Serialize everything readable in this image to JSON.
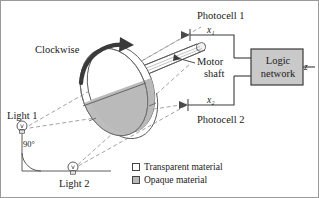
{
  "figure": {
    "border_color": "#9a9a9a",
    "background": "#ffffff"
  },
  "labels": {
    "photocell_1": "Photocell 1",
    "photocell_2": "Photocell 2",
    "input_x1": "x₁",
    "input_x2": "x₂",
    "motor_line1": "Motor",
    "motor_line2": "shaft",
    "clockwise": "Clockwise",
    "light_1": "Light 1",
    "light_2": "Light 2",
    "angle": "90°",
    "output_z": "z",
    "logic_line1": "Logic",
    "logic_line2": "network"
  },
  "legend": {
    "items": [
      {
        "label": "Transparent material",
        "swatch": "transparent-swatch",
        "color": "#ffffff"
      },
      {
        "label": "Opaque material",
        "swatch": "opaque-swatch",
        "color": "#b9b9b9"
      }
    ]
  },
  "colors": {
    "opaque_fill": "#b9b9b9",
    "transparent_fill": "#ffffff",
    "logic_box_fill": "#c9c9c9",
    "line": "#4a4a4a",
    "dashed_ray": "#7a7a7a",
    "arrow_dark": "#3a3a3a"
  },
  "icons": {
    "light_bulb": "light-bulb-icon",
    "photocell": "photocell-sensor-icon",
    "rotation_arrow": "clockwise-rotation-arrow-icon"
  }
}
